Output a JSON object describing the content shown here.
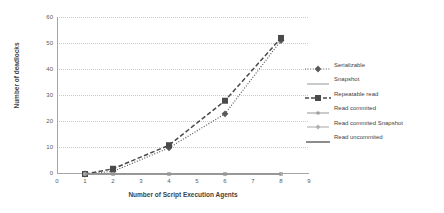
{
  "chart_data": {
    "type": "line",
    "title": "",
    "xlabel": "Number of Script Execution Agents",
    "ylabel": "Number of deadlocks",
    "xlim": [
      0,
      9
    ],
    "ylim": [
      0,
      60
    ],
    "xticks": [
      "0",
      "1",
      "2",
      "3",
      "4",
      "5",
      "6",
      "7",
      "8",
      "9"
    ],
    "yticks": [
      "0",
      "10",
      "20",
      "30",
      "40",
      "50",
      "60"
    ],
    "grid": true,
    "legend_position": "right",
    "x": [
      1,
      2,
      4,
      6,
      8
    ],
    "series": [
      {
        "name": "Serializable",
        "values": [
          0,
          1,
          10,
          23,
          51
        ],
        "color": "#595959",
        "marker": "diamond",
        "line": "dotted"
      },
      {
        "name": "Snapshot",
        "values": [
          0,
          0,
          0,
          0,
          0
        ],
        "color": "#a6a6a6",
        "marker": "none",
        "line": "solid"
      },
      {
        "name": "Repeatable read",
        "values": [
          0,
          2,
          11,
          28,
          52
        ],
        "color": "#4a4a4a",
        "marker": "square",
        "line": "dashed"
      },
      {
        "name": "Read commited",
        "values": [
          0,
          0,
          0,
          0,
          0
        ],
        "color": "#9e9e9e",
        "marker": "square-small",
        "line": "solid"
      },
      {
        "name": "Read commited Snapshot",
        "values": [
          0,
          0,
          0,
          0,
          0
        ],
        "color": "#b0b0b0",
        "marker": "diamond-small",
        "line": "solid"
      },
      {
        "name": "Read uncommited",
        "values": [
          0,
          0,
          0,
          0,
          0
        ],
        "color": "#808080",
        "marker": "none",
        "line": "solid"
      }
    ]
  },
  "axes": {
    "y_title": "Number of deadlocks",
    "x_title": "Number of Script Execution Agents",
    "y_labels": [
      "60",
      "50",
      "40",
      "30",
      "20",
      "10",
      "0"
    ],
    "x_labels": [
      "0",
      "1",
      "2",
      "3",
      "4",
      "5",
      "6",
      "7",
      "8",
      "9"
    ]
  },
  "legend": {
    "items": [
      {
        "label": "Serializable"
      },
      {
        "label": "Snapshot"
      },
      {
        "label": "Repeatable read"
      },
      {
        "label": "Read commited"
      },
      {
        "label": "Read commited Snapshot"
      },
      {
        "label": "Read uncommited"
      }
    ]
  }
}
